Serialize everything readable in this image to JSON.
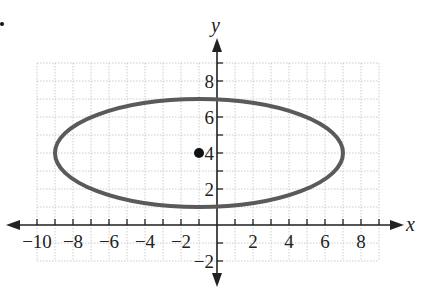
{
  "chart_data": {
    "type": "scatter",
    "title": "",
    "xlabel": "x",
    "ylabel": "y",
    "xlim": [
      -10,
      9
    ],
    "ylim": [
      -2,
      9
    ],
    "grid": true,
    "x_ticks": [
      -10,
      -8,
      -6,
      -4,
      -2,
      2,
      4,
      6,
      8
    ],
    "x_tick_labels": [
      "−10",
      "−8",
      "−6",
      "−4",
      "−2",
      "2",
      "4",
      "6",
      "8"
    ],
    "y_ticks": [
      -2,
      2,
      4,
      6,
      8
    ],
    "y_tick_labels": [
      "−2",
      "2",
      "4",
      "6",
      "8"
    ],
    "ellipse": {
      "center": [
        -1,
        4
      ],
      "semi_major_x": 8,
      "semi_minor_y": 3,
      "equation": "(x+1)^2/64 + (y-4)^2/9 = 1",
      "stroke_color": "#555555"
    },
    "points": [
      {
        "label": "center",
        "x": -1,
        "y": 4,
        "color": "#111111"
      }
    ],
    "legend": null
  },
  "colors": {
    "grid": "#cccccc",
    "axis": "#222222",
    "curve": "#5a5a5a",
    "point": "#111111"
  }
}
